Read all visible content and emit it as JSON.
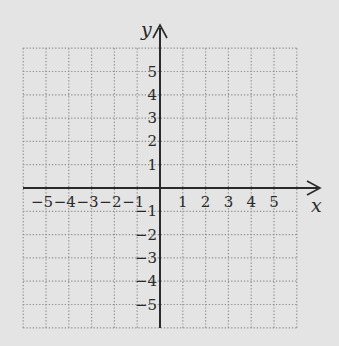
{
  "diagram": {
    "type": "coordinate-plane",
    "background_color": "#e4e4e4",
    "grid_color": "#8a8a8a",
    "axis_color": "#2a2a2a",
    "x_axis": {
      "label": "x",
      "grid_min": -6,
      "grid_max": 6,
      "tick_labels": [
        "−5",
        "−4",
        "−3",
        "−2",
        "−1",
        "1",
        "2",
        "3",
        "4",
        "5"
      ],
      "tick_values": [
        -5,
        -4,
        -3,
        -2,
        -1,
        1,
        2,
        3,
        4,
        5
      ]
    },
    "y_axis": {
      "label": "y",
      "grid_min": -6,
      "grid_max": 6,
      "tick_labels": [
        "5",
        "4",
        "3",
        "2",
        "1",
        "−1",
        "−2",
        "−3",
        "−4",
        "−5"
      ],
      "tick_values": [
        5,
        4,
        3,
        2,
        1,
        -1,
        -2,
        -3,
        -4,
        -5
      ]
    },
    "grid": {
      "style": "dotted",
      "cells_x": 12,
      "cells_y": 12
    }
  }
}
